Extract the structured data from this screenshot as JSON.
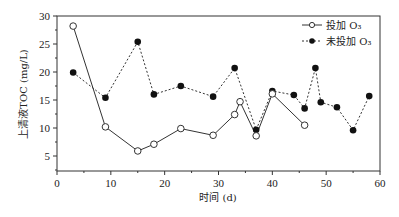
{
  "chart_data": {
    "type": "line",
    "title": "",
    "xlabel": "时间 (d)",
    "ylabel": "上清液TOC (mg/L)",
    "xlim": [
      0,
      60
    ],
    "ylim": [
      2.3,
      30
    ],
    "xticks": [
      0,
      10,
      20,
      30,
      40,
      50,
      60
    ],
    "yticks": [
      5,
      10,
      15,
      20,
      25,
      30
    ],
    "grid": false,
    "legend_position": "upper right",
    "series": [
      {
        "name": "投加 O3",
        "marker": "open-circle",
        "line": "solid",
        "x": [
          3,
          9,
          15,
          18,
          23,
          29,
          33,
          34,
          37,
          40,
          46
        ],
        "y": [
          28.2,
          10.2,
          5.9,
          7.1,
          9.9,
          8.7,
          12.4,
          14.7,
          8.6,
          16.1,
          10.5
        ]
      },
      {
        "name": "未投加 O3",
        "marker": "filled-circle",
        "line": "dotted",
        "x": [
          3,
          9,
          15,
          18,
          23,
          29,
          33,
          37,
          40,
          44,
          46,
          48,
          49,
          52,
          55,
          58
        ],
        "y": [
          19.9,
          15.4,
          25.4,
          16.0,
          17.5,
          15.6,
          20.7,
          9.7,
          16.6,
          15.9,
          13.5,
          20.7,
          14.6,
          13.7,
          9.6,
          15.7
        ]
      }
    ]
  },
  "legend": {
    "items": [
      {
        "label": "投加 O₃",
        "marker": "open-circle-icon"
      },
      {
        "label": "未投加 O₃",
        "marker": "filled-circle-icon"
      }
    ]
  },
  "axes": {
    "x_title": "时间 (d)",
    "y_title": "上清液TOC (mg/L)"
  },
  "colors": {
    "line": "#333333",
    "marker_fill": "#111111",
    "open_marker_fill": "#ffffff"
  }
}
